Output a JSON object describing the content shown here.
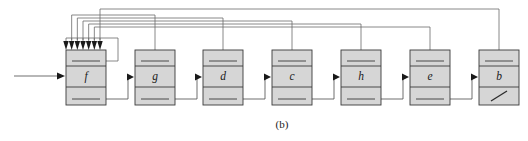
{
  "figure": {
    "caption": "(b)",
    "caption_x": 282,
    "caption_y": 128,
    "kind": "linked-list-diagram",
    "background_color": "#ffffff",
    "node_fill_color": "#d6d6d6",
    "node_border_color": "#3a3a3a",
    "link_color": "#555555",
    "arrow_color": "#1a1a1a"
  },
  "layout": {
    "node_width": 40,
    "node_top": 50,
    "node_bottom": 105,
    "divider_1_y": 66,
    "divider_2_y": 87,
    "data_label_y": 77,
    "entry_arrow_x_start": 14,
    "entry_arrow_y": 76,
    "header_arrow_cluster_count": 7,
    "header_arrow_cluster_x_start": 66,
    "header_arrow_cluster_x_end": 100,
    "header_arrow_tip_y": 50
  },
  "nodes": [
    {
      "id": "n1",
      "label": "f",
      "x": 66,
      "next_label": "g",
      "backlink_rail_y": 12,
      "has_null": false
    },
    {
      "id": "n2",
      "label": "g",
      "x": 135,
      "next_label": "d",
      "backlink_rail_y": 15,
      "has_null": false
    },
    {
      "id": "n3",
      "label": "d",
      "x": 203,
      "next_label": "c",
      "backlink_rail_y": 18,
      "has_null": false
    },
    {
      "id": "n4",
      "label": "c",
      "x": 272,
      "next_label": "h",
      "backlink_rail_y": 21,
      "has_null": false
    },
    {
      "id": "n5",
      "label": "h",
      "x": 341,
      "next_label": "e",
      "backlink_rail_y": 24,
      "has_null": false
    },
    {
      "id": "n6",
      "label": "e",
      "x": 410,
      "next_label": "b",
      "backlink_rail_y": 27,
      "has_null": false
    },
    {
      "id": "n7",
      "label": "b",
      "x": 479,
      "next_label": null,
      "backlink_rail_y": 9,
      "has_null": true
    }
  ],
  "legend": {
    "entry_pointer_name": "list-head-entry-arrow",
    "back_pointer_name": "back-pointer-to-header",
    "next_pointer_name": "next-pointer",
    "null_marker_name": "null-pointer-slash"
  }
}
